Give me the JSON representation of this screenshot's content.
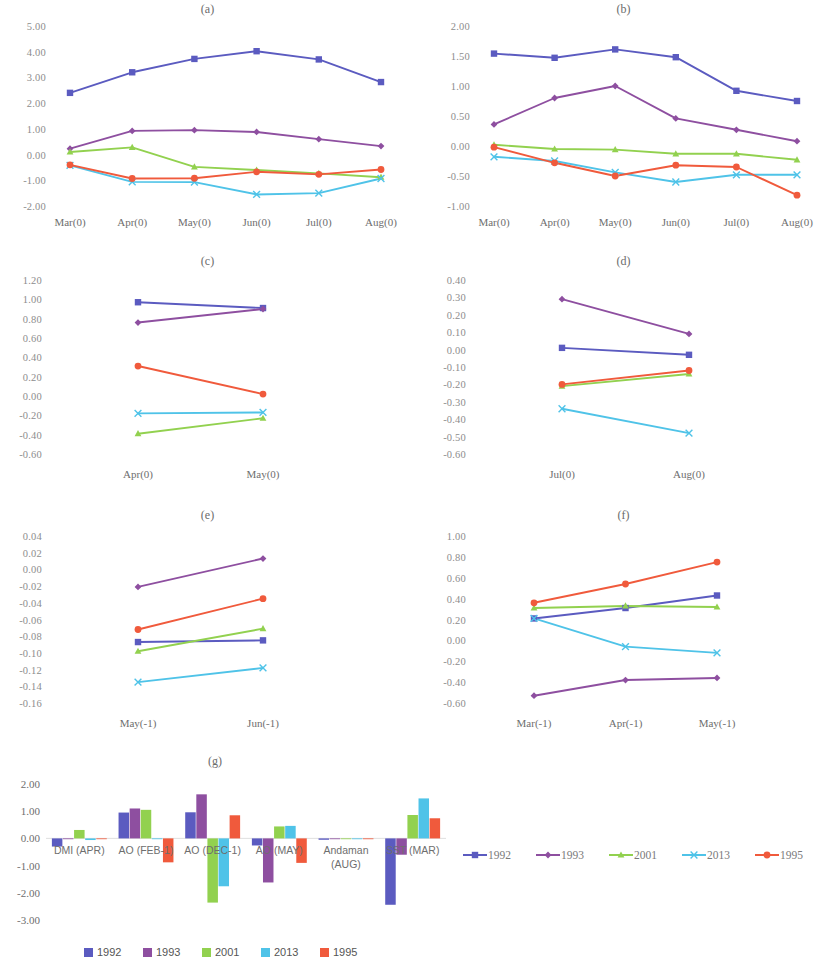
{
  "figure": {
    "series_colors": {
      "1992": "#5b5bc0",
      "1993": "#8e4fa0",
      "2001": "#92d14f",
      "2013": "#4fc3e8",
      "1995": "#f05a3c"
    },
    "series_names": [
      "1992",
      "1993",
      "2001",
      "2013",
      "1995"
    ],
    "series_markers": [
      "square",
      "diamond",
      "triangle",
      "cross",
      "circle"
    ]
  },
  "line_legend": {
    "items": [
      {
        "label": "1992",
        "color": "#5b5bc0"
      },
      {
        "label": "1993",
        "color": "#8e4fa0"
      },
      {
        "label": "2001",
        "color": "#92d14f"
      },
      {
        "label": "2013",
        "color": "#4fc3e8"
      },
      {
        "label": "1995",
        "color": "#f05a3c"
      }
    ]
  },
  "bar_legend": {
    "items": [
      {
        "label": "1992",
        "color": "#5b5bc0"
      },
      {
        "label": "1993",
        "color": "#8e4fa0"
      },
      {
        "label": "2001",
        "color": "#92d14f"
      },
      {
        "label": "2013",
        "color": "#4fc3e8"
      },
      {
        "label": "1995",
        "color": "#f05a3c"
      }
    ]
  },
  "chart_data": [
    {
      "type": "line",
      "title": "(a)",
      "xlabel": "",
      "ylabel": "",
      "categories": [
        "Mar(0)",
        "Apr(0)",
        "May(0)",
        "Jun(0)",
        "Jul(0)",
        "Aug(0)"
      ],
      "yticks": [
        "5.00",
        "4.00",
        "3.00",
        "2.00",
        "1.00",
        "0.00",
        "-1.00",
        "-2.00"
      ],
      "ylim": [
        -2.0,
        5.0
      ],
      "grid": false,
      "legend": "external",
      "series": [
        {
          "name": "1992",
          "values": [
            2.4,
            3.2,
            3.72,
            4.02,
            3.7,
            2.82
          ]
        },
        {
          "name": "1993",
          "values": [
            0.23,
            0.92,
            0.95,
            0.88,
            0.6,
            0.33
          ]
        },
        {
          "name": "2001",
          "values": [
            0.1,
            0.28,
            -0.48,
            -0.6,
            -0.73,
            -0.88
          ]
        },
        {
          "name": "2013",
          "values": [
            -0.42,
            -1.06,
            -1.07,
            -1.55,
            -1.5,
            -0.93
          ]
        },
        {
          "name": "1995",
          "values": [
            -0.4,
            -0.93,
            -0.92,
            -0.67,
            -0.77,
            -0.58
          ]
        }
      ]
    },
    {
      "type": "line",
      "title": "(b)",
      "xlabel": "",
      "ylabel": "",
      "categories": [
        "Mar(0)",
        "Apr(0)",
        "May(0)",
        "Jun(0)",
        "Jul(0)",
        "Aug(0)"
      ],
      "yticks": [
        "2.00",
        "1.50",
        "1.00",
        "0.50",
        "0.00",
        "-0.50",
        "-1.00"
      ],
      "ylim": [
        -1.0,
        2.0
      ],
      "grid": false,
      "legend": "external",
      "series": [
        {
          "name": "1992",
          "values": [
            1.54,
            1.47,
            1.61,
            1.48,
            0.92,
            0.75
          ]
        },
        {
          "name": "1993",
          "values": [
            0.36,
            0.8,
            1.0,
            0.46,
            0.27,
            0.08
          ]
        },
        {
          "name": "2001",
          "values": [
            0.02,
            -0.05,
            -0.06,
            -0.13,
            -0.13,
            -0.23
          ]
        },
        {
          "name": "2013",
          "values": [
            -0.18,
            -0.25,
            -0.44,
            -0.6,
            -0.48,
            -0.48
          ]
        },
        {
          "name": "1995",
          "values": [
            -0.02,
            -0.28,
            -0.5,
            -0.32,
            -0.35,
            -0.82
          ]
        }
      ]
    },
    {
      "type": "line",
      "title": "(c)",
      "xlabel": "",
      "ylabel": "",
      "categories": [
        "Apr(0)",
        "May(0)"
      ],
      "yticks": [
        "1.20",
        "1.00",
        "0.80",
        "0.60",
        "0.40",
        "0.20",
        "0.00",
        "-0.20",
        "-0.40",
        "-0.60"
      ],
      "ylim": [
        -0.6,
        1.2
      ],
      "grid": false,
      "legend": "external",
      "series": [
        {
          "name": "1992",
          "values": [
            0.97,
            0.91
          ]
        },
        {
          "name": "1993",
          "values": [
            0.76,
            0.9
          ]
        },
        {
          "name": "2001",
          "values": [
            -0.39,
            -0.23
          ]
        },
        {
          "name": "2013",
          "values": [
            -0.18,
            -0.17
          ]
        },
        {
          "name": "1995",
          "values": [
            0.31,
            0.02
          ]
        }
      ]
    },
    {
      "type": "line",
      "title": "(d)",
      "xlabel": "",
      "ylabel": "",
      "categories": [
        "Jul(0)",
        "Aug(0)"
      ],
      "yticks": [
        "0.40",
        "0.30",
        "0.20",
        "0.10",
        "0.00",
        "-0.10",
        "-0.20",
        "-0.30",
        "-0.40",
        "-0.50",
        "-0.60"
      ],
      "ylim": [
        -0.6,
        0.4
      ],
      "grid": false,
      "legend": "external",
      "series": [
        {
          "name": "1992",
          "values": [
            0.01,
            -0.03
          ]
        },
        {
          "name": "1993",
          "values": [
            0.29,
            0.09
          ]
        },
        {
          "name": "2001",
          "values": [
            -0.21,
            -0.14
          ]
        },
        {
          "name": "2013",
          "values": [
            -0.34,
            -0.48
          ]
        },
        {
          "name": "1995",
          "values": [
            -0.2,
            -0.12
          ]
        }
      ]
    },
    {
      "type": "line",
      "title": "(e)",
      "xlabel": "",
      "ylabel": "",
      "categories": [
        "May(-1)",
        "Jun(-1)"
      ],
      "yticks": [
        "0.04",
        "0.02",
        "0.00",
        "-0.02",
        "-0.04",
        "-0.06",
        "-0.08",
        "-0.10",
        "-0.12",
        "-0.14",
        "-0.16"
      ],
      "ylim": [
        -0.16,
        0.04
      ],
      "grid": false,
      "legend": "external",
      "series": [
        {
          "name": "1992",
          "values": [
            -0.087,
            -0.085
          ]
        },
        {
          "name": "1993",
          "values": [
            -0.021,
            0.013
          ]
        },
        {
          "name": "2001",
          "values": [
            -0.098,
            -0.071
          ]
        },
        {
          "name": "2013",
          "values": [
            -0.135,
            -0.118
          ]
        },
        {
          "name": "1995",
          "values": [
            -0.072,
            -0.035
          ]
        }
      ]
    },
    {
      "type": "line",
      "title": "(f)",
      "xlabel": "",
      "ylabel": "",
      "categories": [
        "Mar(-1)",
        "Apr(-1)",
        "May(-1)"
      ],
      "yticks": [
        "1.00",
        "0.80",
        "0.60",
        "0.40",
        "0.20",
        "0.00",
        "-0.20",
        "-0.40",
        "-0.60"
      ],
      "ylim": [
        -0.6,
        1.0
      ],
      "grid": false,
      "legend": "external",
      "series": [
        {
          "name": "1992",
          "values": [
            0.21,
            0.31,
            0.43
          ]
        },
        {
          "name": "1993",
          "values": [
            -0.53,
            -0.38,
            -0.36
          ]
        },
        {
          "name": "2001",
          "values": [
            0.31,
            0.33,
            0.32
          ]
        },
        {
          "name": "2013",
          "values": [
            0.21,
            -0.06,
            -0.12
          ]
        },
        {
          "name": "1995",
          "values": [
            0.36,
            0.54,
            0.75
          ]
        }
      ]
    },
    {
      "type": "bar",
      "title": "(g)",
      "xlabel": "",
      "ylabel": "",
      "categories": [
        "DMI (APR)",
        "AO (FEB-1)",
        "AO (DEC-1)",
        "AO (MAY)",
        "Andaman (AUG)",
        "SST (MAR)"
      ],
      "yticks": [
        "2.00",
        "1.00",
        "0.00",
        "-1.00",
        "-2.00",
        "-3.00"
      ],
      "ylim": [
        -3.0,
        2.0
      ],
      "grid": false,
      "legend": "bottom",
      "series": [
        {
          "name": "1992",
          "values": [
            -0.3,
            0.95,
            0.96,
            -0.26,
            -0.05,
            -2.44
          ]
        },
        {
          "name": "1993",
          "values": [
            0.0,
            1.1,
            1.62,
            -1.62,
            -0.02,
            -0.6
          ]
        },
        {
          "name": "2001",
          "values": [
            0.31,
            1.05,
            -2.36,
            0.44,
            -0.02,
            0.86
          ]
        },
        {
          "name": "2013",
          "values": [
            -0.06,
            0.0,
            -1.76,
            0.46,
            -0.03,
            1.47
          ]
        },
        {
          "name": "1995",
          "values": [
            -0.02,
            -0.88,
            0.85,
            -0.9,
            -0.03,
            0.74
          ]
        }
      ]
    }
  ]
}
